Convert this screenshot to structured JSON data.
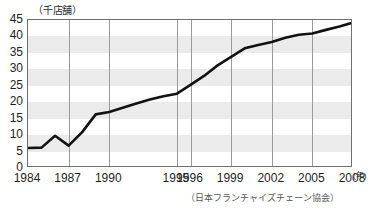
{
  "chart_data": {
    "type": "line",
    "title": "",
    "subtitle": "",
    "xlabel": "(年)",
    "ylabel": "(千店舗)",
    "ylim": [
      0,
      45
    ],
    "xlim": [
      1984,
      2008
    ],
    "grid": "horizontal-bands-and-vertical-gridlines",
    "legend": "none",
    "y_ticks": [
      "45",
      "40",
      "35",
      "30",
      "25",
      "20",
      "15",
      "10",
      "5",
      "0"
    ],
    "y_tick_values": [
      45,
      40,
      35,
      30,
      25,
      20,
      15,
      10,
      5,
      0
    ],
    "x_tick_labels": [
      "1984",
      "1987",
      "1990",
      "1995",
      "1996",
      "1999",
      "2002",
      "2005",
      "2008"
    ],
    "x_tick_values": [
      1984,
      1987,
      1990,
      1995,
      1996,
      1999,
      2002,
      2005,
      2008
    ],
    "series": [
      {
        "name": "店舗数",
        "color": "#121212",
        "x": [
          1984,
          1985,
          1986,
          1987,
          1988,
          1989,
          1990,
          1991,
          1992,
          1993,
          1994,
          1995,
          1996,
          1997,
          1998,
          1999,
          2000,
          2001,
          2002,
          2003,
          2004,
          2005,
          2006,
          2007,
          2008
        ],
        "values": [
          6.1,
          6.2,
          9.8,
          6.8,
          10.9,
          16.3,
          17.0,
          18.3,
          19.6,
          20.8,
          21.8,
          22.6,
          25.3,
          28.0,
          31.2,
          33.8,
          36.4,
          37.4,
          38.3,
          39.6,
          40.5,
          40.9,
          42.0,
          43.0,
          44.2
        ]
      }
    ],
    "source": "（日本フランチャイズチェーン協会）",
    "units": "千店舗"
  },
  "axis": {
    "unit_label": "（千店舗）",
    "x_unit_label": "(年)"
  },
  "footer": {
    "source": "（日本フランチャイズチェーン協会）"
  }
}
